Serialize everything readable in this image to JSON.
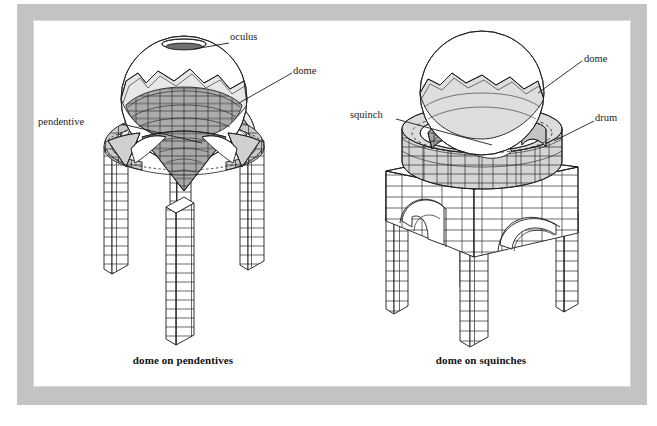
{
  "figure": {
    "background_color": "#ffffff",
    "frame_color": "#c3c3c3",
    "ink_color": "#1b1b1b",
    "shade_light": "#e3e3e3",
    "shade_mid": "#c9c9c9",
    "shade_dark": "#a8a8a8"
  },
  "panels": [
    {
      "id": "dome-on-pendentives",
      "caption": "dome on pendentives",
      "labels": [
        {
          "key": "oculus",
          "text": "oculus"
        },
        {
          "key": "dome",
          "text": "dome"
        },
        {
          "key": "pendentive",
          "text": "pendentive"
        }
      ]
    },
    {
      "id": "dome-on-squinches",
      "caption": "dome on squinches",
      "labels": [
        {
          "key": "dome",
          "text": "dome"
        },
        {
          "key": "squinch",
          "text": "squinch"
        },
        {
          "key": "drum",
          "text": "drum"
        }
      ]
    }
  ]
}
